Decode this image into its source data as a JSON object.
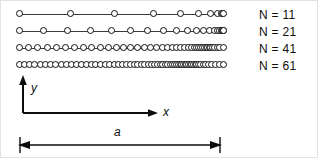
{
  "figure": {
    "kind": "point-distribution-diagram",
    "axes": {
      "x_label": "x",
      "y_label": "y"
    },
    "dimension": {
      "label": "a"
    }
  },
  "chart_data": {
    "type": "scatter",
    "title": "",
    "xlabel": "x",
    "ylabel": "y",
    "grid": false,
    "legend_position": "right",
    "xlim": [
      0,
      1
    ],
    "annotations": [
      "a"
    ],
    "series": [
      {
        "name": "N = 11",
        "count": 11,
        "row": 0,
        "x": [
          0.0,
          0.25,
          0.47,
          0.66,
          0.79,
          0.88,
          0.94,
          0.975,
          0.992,
          0.999,
          1.0
        ]
      },
      {
        "name": "N = 21",
        "count": 21,
        "row": 1,
        "x": [
          0.0,
          0.122,
          0.24,
          0.352,
          0.455,
          0.548,
          0.632,
          0.706,
          0.77,
          0.824,
          0.869,
          0.905,
          0.934,
          0.956,
          0.972,
          0.984,
          0.992,
          0.996,
          0.999,
          1.0,
          1.0
        ]
      },
      {
        "name": "N = 41",
        "count": 41,
        "row": 2,
        "x": [
          0.0,
          0.046,
          0.092,
          0.138,
          0.183,
          0.228,
          0.272,
          0.315,
          0.357,
          0.398,
          0.438,
          0.476,
          0.513,
          0.549,
          0.583,
          0.616,
          0.647,
          0.676,
          0.703,
          0.729,
          0.752,
          0.774,
          0.794,
          0.812,
          0.829,
          0.844,
          0.858,
          0.87,
          0.881,
          0.891,
          0.9,
          0.909,
          0.917,
          0.925,
          0.933,
          0.941,
          0.95,
          0.96,
          0.971,
          0.985,
          1.0
        ]
      },
      {
        "name": "N = 61",
        "count": 61,
        "row": 3,
        "x": [
          0.0,
          0.026,
          0.052,
          0.078,
          0.104,
          0.13,
          0.156,
          0.181,
          0.207,
          0.232,
          0.257,
          0.282,
          0.306,
          0.33,
          0.354,
          0.377,
          0.4,
          0.422,
          0.444,
          0.466,
          0.487,
          0.507,
          0.527,
          0.546,
          0.565,
          0.583,
          0.6,
          0.617,
          0.633,
          0.649,
          0.664,
          0.678,
          0.692,
          0.705,
          0.718,
          0.73,
          0.741,
          0.752,
          0.762,
          0.772,
          0.781,
          0.79,
          0.799,
          0.807,
          0.815,
          0.823,
          0.831,
          0.839,
          0.847,
          0.855,
          0.863,
          0.872,
          0.881,
          0.891,
          0.902,
          0.914,
          0.928,
          0.944,
          0.963,
          0.982,
          1.0
        ]
      }
    ],
    "legend": [
      "N = 11",
      "N = 21",
      "N = 41",
      "N = 61"
    ]
  },
  "colors": {
    "marker_stroke": "#111111",
    "marker_fill": "#ffffff",
    "baseline": "#3a3a3a",
    "axis": "#0d0d0d",
    "text": "#0d0d0d",
    "border": "#e2e2e2"
  }
}
